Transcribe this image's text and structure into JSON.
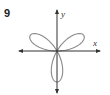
{
  "problem": {
    "number": "9"
  },
  "chart_data": {
    "type": "line",
    "subtype": "polar-rose",
    "title": "",
    "equation_form": "r = a sin(3θ)",
    "petals": 3,
    "petal_directions_deg": [
      30,
      150,
      270
    ],
    "xlabel": "x",
    "ylabel": "y",
    "axes": {
      "x_arrows": "both",
      "y_arrows": "both",
      "grid": false,
      "ticks": false
    },
    "curve_color": "#8a8a8a",
    "axis_color": "#333333"
  },
  "labels": {
    "x": "x",
    "y": "y"
  }
}
